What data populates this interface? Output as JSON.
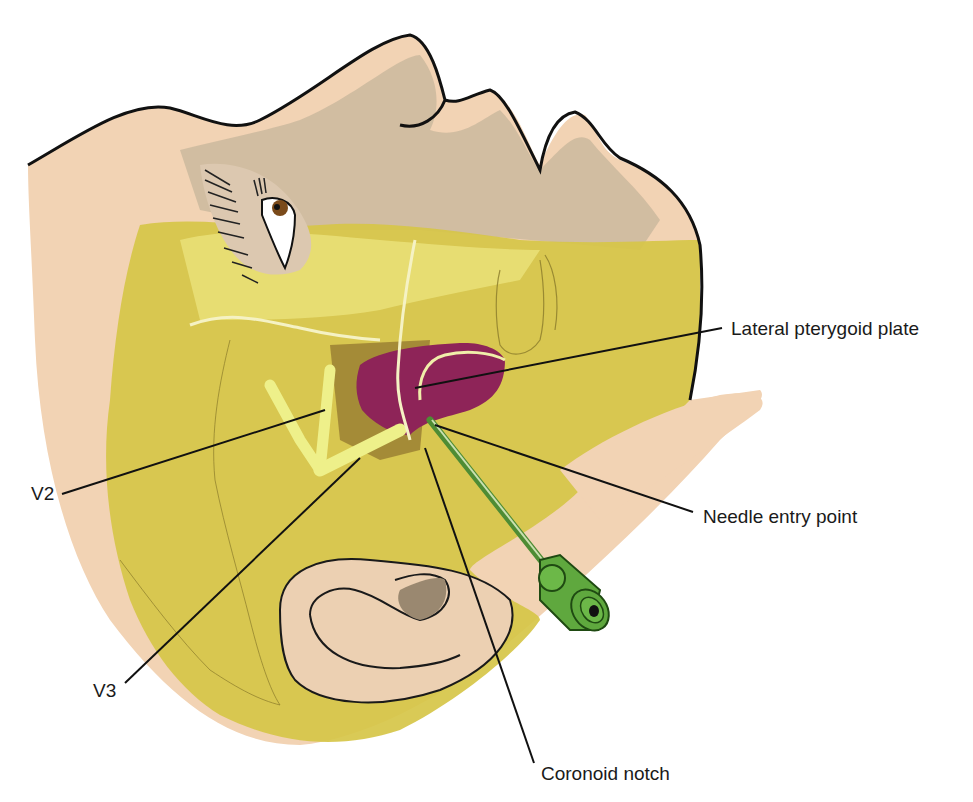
{
  "figure": {
    "labels": {
      "lateral_pterygoid_plate": "Lateral pterygoid plate",
      "v2": "V2",
      "v3": "V3",
      "needle_entry_point": "Needle entry point",
      "coronoid_notch": "Coronoid notch"
    },
    "colors": {
      "skin": "#f2d3b4",
      "skin_shadow": "#c9b49a",
      "yellow_region": "#d9c64a",
      "yellow_light": "#ebe27a",
      "nerve": "#eef08a",
      "pterygoid_plate": "#8e2458",
      "needle": "#5fa83e",
      "outline": "#111111",
      "leader_line": "#111111"
    }
  }
}
